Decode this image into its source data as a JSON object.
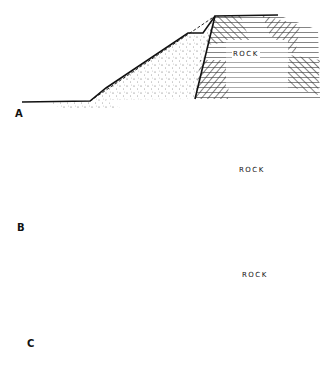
{
  "figure": {
    "panels": [
      {
        "label": "A",
        "rock_label": "ROCK",
        "fill_shape": "single slope over rock face"
      },
      {
        "label": "B",
        "rock_label": "ROCK",
        "fill_shape": "stepped benches over rock face"
      },
      {
        "label": "C",
        "rock_label": "ROCK",
        "fill_shape": "flat fill with ditch at rock face"
      }
    ]
  }
}
